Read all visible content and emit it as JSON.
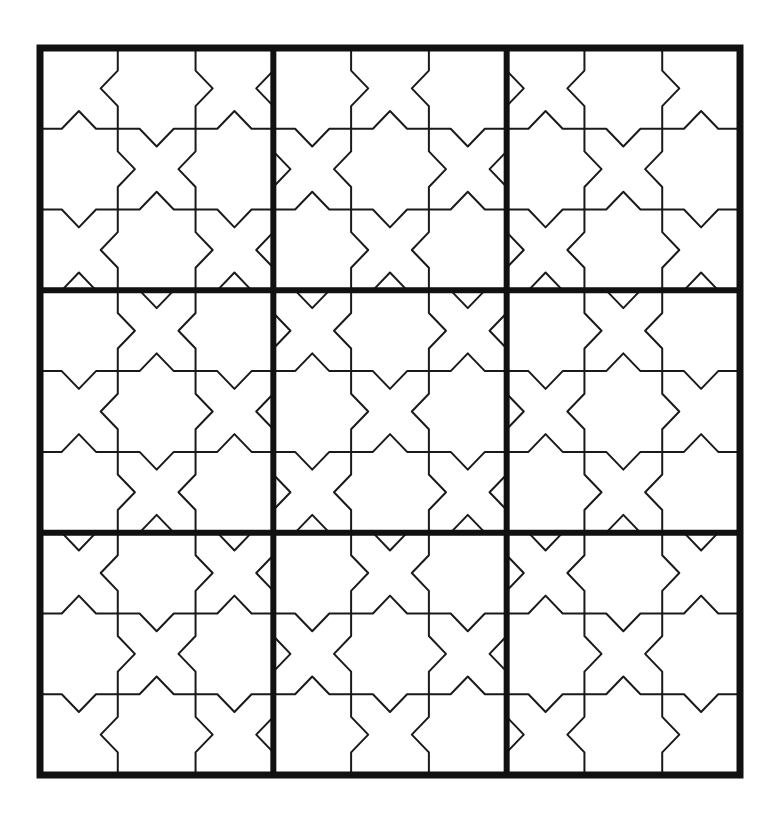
{
  "figure": {
    "type": "geometric-tiling-diagram"
  },
  "canvas": {
    "width": 773,
    "height": 831,
    "background_color": "#ffffff"
  },
  "board": {
    "x": 40,
    "y": 48,
    "width": 700,
    "height": 727,
    "blocks_across": 3,
    "blocks_down": 3,
    "cells_per_block_across": 3,
    "cells_per_block_down": 3,
    "total_cells_across": 9,
    "total_cells_down": 9,
    "outer_border_color": "#111111",
    "outer_border_width": 7,
    "block_divider_color": "#111111",
    "block_divider_width": 6,
    "cell_line_color": "#1a1a1a",
    "cell_line_width": 2.0,
    "fill_color": "#ffffff"
  },
  "tiling": {
    "motif_name": "star-and-cross",
    "notch_depth_ratio": 0.22,
    "notch_half_width_ratio": 0.22,
    "phase_pattern": [
      [
        "star",
        "cross",
        "star"
      ],
      [
        "star",
        "cross",
        "cross"
      ],
      [
        "star",
        "star",
        "cross"
      ]
    ]
  },
  "chart_data": {
    "type": "table",
    "categories": [
      "Block 1",
      "Block 2",
      "Block 3",
      "Block 4",
      "Block 5",
      "Block 6",
      "Block 7",
      "Block 8",
      "Block 9"
    ],
    "values": [
      9,
      9,
      9,
      9,
      9,
      9,
      9,
      9,
      9
    ],
    "xlabel": "Block",
    "ylabel": "Cells per block",
    "blocks": [
      {
        "row": 0,
        "col": 0,
        "center_motif": "star",
        "cells": 9
      },
      {
        "row": 0,
        "col": 1,
        "center_motif": "cross",
        "cells": 9
      },
      {
        "row": 0,
        "col": 2,
        "center_motif": "star",
        "cells": 9
      },
      {
        "row": 1,
        "col": 0,
        "center_motif": "star",
        "cells": 9
      },
      {
        "row": 1,
        "col": 1,
        "center_motif": "cross",
        "cells": 9
      },
      {
        "row": 1,
        "col": 2,
        "center_motif": "cross",
        "cells": 9
      },
      {
        "row": 2,
        "col": 0,
        "center_motif": "star",
        "cells": 9
      },
      {
        "row": 2,
        "col": 1,
        "center_motif": "star",
        "cells": 9
      },
      {
        "row": 2,
        "col": 2,
        "center_motif": "cross",
        "cells": 9
      }
    ],
    "grid": true,
    "legend": []
  }
}
